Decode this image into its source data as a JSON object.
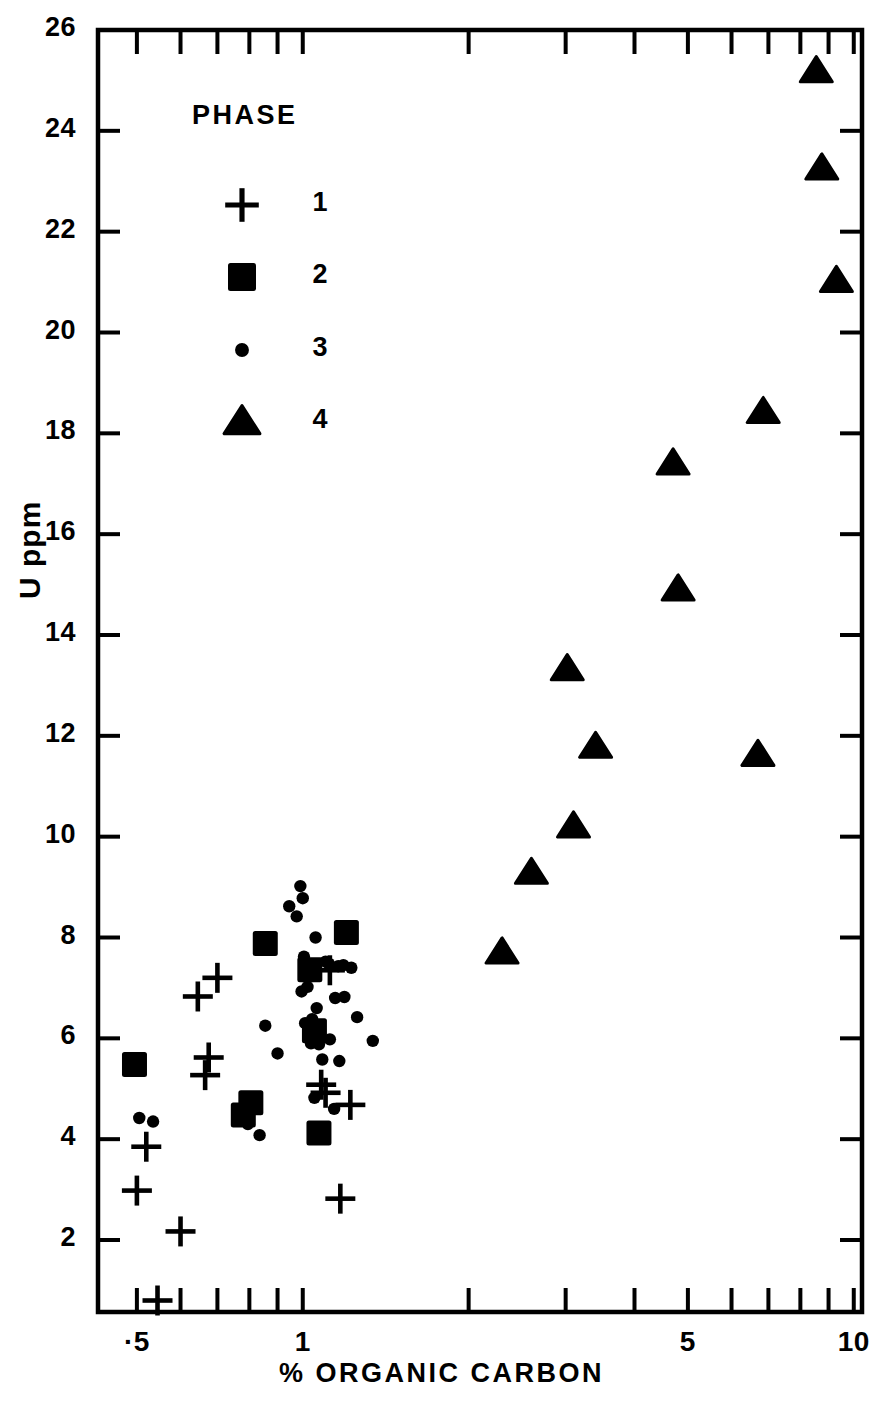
{
  "chart_data": {
    "type": "scatter",
    "title": "",
    "xlabel": "% ORGANIC CARBON",
    "ylabel": "U ppm",
    "xscale": "log",
    "yscale": "linear",
    "xlim": [
      0.4,
      10
    ],
    "ylim": [
      0.4,
      26
    ],
    "grid": false,
    "legend_title": "PHASE",
    "legend_position": "upper-left-inside",
    "x_tick_labels": [
      {
        "value": 0.5,
        "label": "·5"
      },
      {
        "value": 1,
        "label": "1"
      },
      {
        "value": 5,
        "label": "5"
      },
      {
        "value": 10,
        "label": "10"
      }
    ],
    "x_minor_ticks": [
      0.5,
      0.6,
      0.7,
      0.8,
      0.9,
      1,
      2,
      3,
      4,
      5,
      6,
      7,
      8,
      9,
      10
    ],
    "y_tick_labels": [
      {
        "value": 26,
        "label": "26"
      },
      {
        "value": 24,
        "label": "24"
      },
      {
        "value": 22,
        "label": "22"
      },
      {
        "value": 20,
        "label": "20"
      },
      {
        "value": 18,
        "label": "18"
      },
      {
        "value": 16,
        "label": "16"
      },
      {
        "value": 14,
        "label": "14"
      },
      {
        "value": 12,
        "label": "12"
      },
      {
        "value": 10,
        "label": "10"
      },
      {
        "value": 8,
        "label": "8"
      },
      {
        "value": 6,
        "label": "6"
      },
      {
        "value": 4,
        "label": "4"
      },
      {
        "value": 2,
        "label": "2"
      }
    ],
    "series": [
      {
        "name": "1",
        "legend_label": "1",
        "marker": "plus",
        "color": "#000000",
        "points": [
          [
            0.5,
            2.98
          ],
          [
            0.52,
            3.85
          ],
          [
            0.545,
            0.8
          ],
          [
            0.6,
            2.17
          ],
          [
            0.645,
            6.83
          ],
          [
            0.665,
            5.27
          ],
          [
            0.675,
            5.62
          ],
          [
            0.7,
            7.2
          ],
          [
            1.08,
            5.08
          ],
          [
            1.1,
            4.92
          ],
          [
            1.12,
            7.35
          ],
          [
            1.17,
            2.82
          ],
          [
            1.22,
            4.68
          ]
        ]
      },
      {
        "name": "2",
        "legend_label": "2",
        "marker": "square",
        "color": "#000000",
        "points": [
          [
            0.495,
            5.48
          ],
          [
            0.78,
            4.48
          ],
          [
            0.805,
            4.72
          ],
          [
            0.855,
            7.88
          ],
          [
            1.03,
            7.36
          ],
          [
            1.05,
            6.15
          ],
          [
            1.07,
            4.12
          ],
          [
            1.2,
            8.1
          ]
        ]
      },
      {
        "name": "3",
        "legend_label": "3",
        "marker": "dot",
        "color": "#000000",
        "points": [
          [
            0.505,
            4.42
          ],
          [
            0.535,
            4.35
          ],
          [
            0.795,
            4.3
          ],
          [
            0.835,
            4.08
          ],
          [
            0.855,
            6.25
          ],
          [
            0.9,
            5.7
          ],
          [
            0.945,
            8.62
          ],
          [
            0.975,
            8.42
          ],
          [
            0.99,
            9.02
          ],
          [
            0.995,
            6.93
          ],
          [
            1.0,
            8.78
          ],
          [
            1.005,
            7.62
          ],
          [
            1.01,
            6.3
          ],
          [
            1.02,
            7.02
          ],
          [
            1.035,
            5.9
          ],
          [
            1.04,
            6.38
          ],
          [
            1.05,
            4.82
          ],
          [
            1.055,
            8.0
          ],
          [
            1.06,
            6.6
          ],
          [
            1.07,
            5.88
          ],
          [
            1.085,
            5.58
          ],
          [
            1.1,
            7.52
          ],
          [
            1.115,
            7.48
          ],
          [
            1.12,
            5.98
          ],
          [
            1.14,
            4.6
          ],
          [
            1.145,
            6.8
          ],
          [
            1.16,
            7.43
          ],
          [
            1.165,
            5.55
          ],
          [
            1.185,
            7.45
          ],
          [
            1.19,
            6.82
          ],
          [
            1.225,
            7.4
          ],
          [
            1.255,
            6.42
          ],
          [
            1.34,
            5.95
          ]
        ]
      },
      {
        "name": "4",
        "legend_label": "4",
        "marker": "triangle",
        "color": "#000000",
        "points": [
          [
            2.3,
            7.7
          ],
          [
            2.6,
            9.28
          ],
          [
            3.02,
            13.32
          ],
          [
            3.1,
            10.2
          ],
          [
            3.4,
            11.78
          ],
          [
            4.7,
            17.4
          ],
          [
            4.8,
            14.9
          ],
          [
            6.7,
            11.62
          ],
          [
            6.85,
            18.42
          ],
          [
            8.55,
            25.18
          ],
          [
            8.75,
            23.25
          ],
          [
            9.3,
            21.02
          ]
        ]
      }
    ]
  },
  "legend": {
    "title": "PHASE",
    "entries": [
      {
        "marker": "plus",
        "label": "1"
      },
      {
        "marker": "square",
        "label": "2"
      },
      {
        "marker": "dot",
        "label": "3"
      },
      {
        "marker": "triangle",
        "label": "4"
      }
    ]
  },
  "axes": {
    "x_title": "% ORGANIC CARBON",
    "y_title": "U ppm"
  }
}
